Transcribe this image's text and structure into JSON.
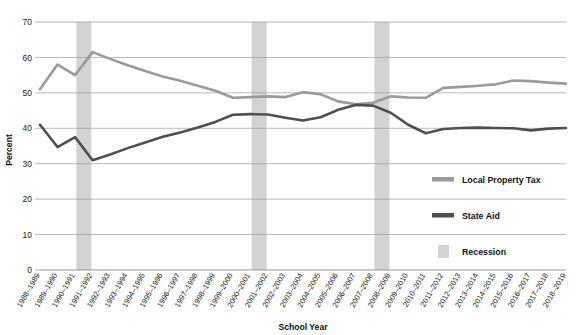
{
  "chart_data": {
    "type": "line",
    "title": "",
    "xlabel": "School Year",
    "ylabel": "Percent",
    "ylim": [
      0,
      70
    ],
    "ytick_step": 10,
    "yticks": [
      "0",
      "10",
      "20",
      "30",
      "40",
      "50",
      "60",
      "70"
    ],
    "grid": true,
    "legend_position": "right-inside",
    "categories": [
      "1988–1989",
      "1989–1990",
      "1990–1991",
      "1991–1992",
      "1992–1993",
      "1993–1994",
      "1994–1995",
      "1995–1996",
      "1996–1997",
      "1997–1998",
      "1998–1999",
      "1999–2000",
      "2000–2001",
      "2001–2002",
      "2002–2003",
      "2003–2004",
      "2004–2005",
      "2005–2006",
      "2006–2007",
      "2007–2008",
      "2008–2009",
      "2009–2010",
      "2010–2011",
      "2011–2012",
      "2012–2013",
      "2013–2014",
      "2014–2015",
      "2015–2016",
      "2016–2017",
      "2017–2018",
      "2018–2019"
    ],
    "series": [
      {
        "name": "Local Property Tax",
        "color": "#9a9a9a",
        "values": [
          51.0,
          58.0,
          55.0,
          61.5,
          59.6,
          57.8,
          56.2,
          54.6,
          53.4,
          52.0,
          50.6,
          48.6,
          48.8,
          49.0,
          48.8,
          50.2,
          49.6,
          47.6,
          46.8,
          47.2,
          49.0,
          48.7,
          48.6,
          51.4,
          51.7,
          52.0,
          52.4,
          53.5,
          53.3,
          52.9,
          52.6
        ]
      },
      {
        "name": "State Aid",
        "color": "#4f4f4f",
        "values": [
          41.0,
          34.7,
          37.5,
          31.0,
          32.6,
          34.4,
          36.0,
          37.6,
          38.8,
          40.2,
          41.8,
          43.8,
          44.0,
          43.9,
          43.0,
          42.2,
          43.1,
          45.2,
          46.6,
          46.4,
          44.4,
          41.0,
          38.6,
          39.8,
          40.1,
          40.2,
          40.1,
          40.0,
          39.4,
          39.9,
          40.1
        ]
      }
    ],
    "recession_label": "Recession",
    "recession_color": "#d3d3d3",
    "recessions": [
      {
        "start_category": "1990–1991",
        "end_category": "1991–1992"
      },
      {
        "start_category": "2000–2001",
        "end_category": "2001–2002"
      },
      {
        "start_category": "2007–2008",
        "end_category": "2008–2009"
      }
    ]
  },
  "legend": {
    "items": [
      {
        "label": "Local Property Tax",
        "type": "line",
        "color": "#9a9a9a"
      },
      {
        "label": "State Aid",
        "type": "line",
        "color": "#4f4f4f"
      },
      {
        "label": "Recession",
        "type": "band",
        "color": "#d3d3d3"
      }
    ]
  },
  "axes": {
    "y_title": "Percent",
    "x_title": "School Year"
  }
}
